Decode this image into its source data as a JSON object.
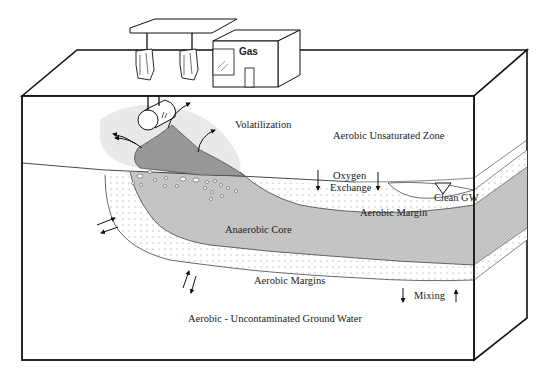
{
  "diagram": {
    "building_sign": "Gas",
    "labels": {
      "volatilization": "Volatilization",
      "aerobic_unsaturated_zone": "Aerobic Unsaturated Zone",
      "oxygen_exchange_line1": "Oxygen",
      "oxygen_exchange_line2": "Exchange",
      "clean_gw": "Clean GW",
      "aerobic_margin": "Aerobic Margin",
      "anaerobic_core": "Anaerobic Core",
      "aerobic_margins": "Aerobic Margins",
      "mixing": "Mixing",
      "uncontaminated": "Aerobic - Uncontaminated Ground Water"
    },
    "colors": {
      "outline": "#111111",
      "free_product": "#9a9a9a",
      "vapor_halo": "#e6e6e6",
      "anaerobic_core": "#c4c4c4",
      "aerobic_margin_dots": "#9a9a9a",
      "background": "#ffffff"
    },
    "icons": [
      "fuel-pump-icon",
      "water-table-triangle-icon",
      "arrow-icon"
    ]
  }
}
